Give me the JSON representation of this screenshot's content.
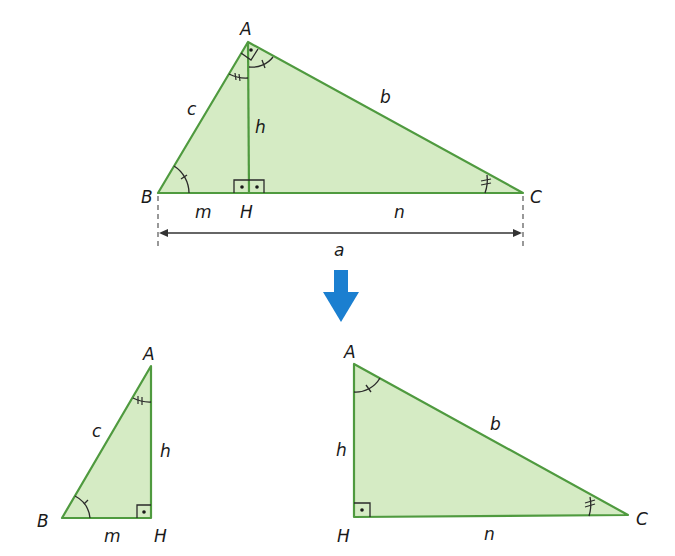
{
  "colors": {
    "fill": "#d5ebc4",
    "stroke": "#4f9a3f",
    "mark": "#2a2a2a",
    "arrow": "#1b7fd0",
    "dimension": "#333333"
  },
  "main_triangle": {
    "vertices": {
      "A": "A",
      "B": "B",
      "C": "C",
      "H": "H"
    },
    "sides": {
      "a": "a",
      "b": "b",
      "c": "c",
      "h": "h",
      "m": "m",
      "n": "n"
    }
  },
  "small_triangle": {
    "vertices": {
      "A": "A",
      "B": "B",
      "H": "H"
    },
    "sides": {
      "c": "c",
      "h": "h",
      "m": "m"
    }
  },
  "right_triangle": {
    "vertices": {
      "A": "A",
      "H": "H",
      "C": "C"
    },
    "sides": {
      "b": "b",
      "h": "h",
      "n": "n"
    }
  },
  "arrow": {
    "direction": "down",
    "icon": "arrow-down-icon"
  }
}
